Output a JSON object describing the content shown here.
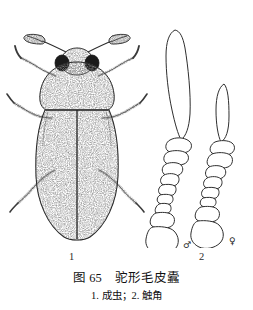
{
  "plate": {
    "figure_number": "图 65",
    "title": "驼形毛皮蠹",
    "caption_line": "图 65　驼形毛皮蠹",
    "legend_line": "1. 成虫；2. 触角",
    "background_color": "#ffffff",
    "ink_color": "#1a1a1a"
  },
  "labels": {
    "adult_index": "1",
    "antenna_index": "2",
    "male_symbol": "♂",
    "female_symbol": "♀"
  },
  "subjects": [
    {
      "index": "1",
      "name": "成虫",
      "english": "adult",
      "view": "dorsal",
      "style": "stippled line engraving",
      "parts": [
        "触角",
        "复眼",
        "前胸背板",
        "鞘翅",
        "足"
      ]
    },
    {
      "index": "2",
      "name": "触角",
      "english": "antenna",
      "variants": [
        {
          "sex": "♂",
          "label": "male",
          "club": "long elongate terminal club"
        },
        {
          "sex": "♀",
          "label": "female",
          "club": "short ovate terminal club"
        }
      ]
    }
  ]
}
